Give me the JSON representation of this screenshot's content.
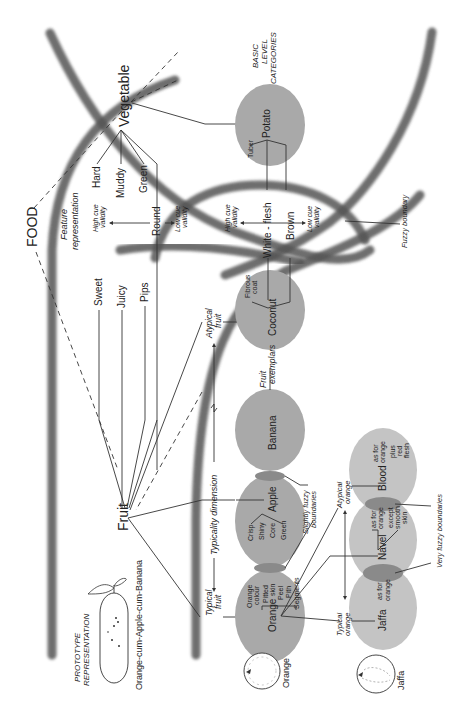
{
  "title": {
    "food": "FOOD",
    "fruit": "Fruit",
    "vegetable": "Vegetable",
    "basic_level": [
      "BASIC",
      "LEVEL",
      "CATEGORIES"
    ]
  },
  "prototype": {
    "heading": [
      "PROTOTYPE",
      "REPRESENTATION"
    ],
    "caption": "Orange-cum-Apple-cum-Banana"
  },
  "feature_representation": {
    "heading": [
      "Feature",
      "representation"
    ],
    "high_cue": [
      "High cue",
      "validity"
    ],
    "low_cue": [
      "Low cue",
      "validity"
    ],
    "fruit_features": [
      "Sweet",
      "Juicy",
      "Pips"
    ],
    "vegetable_features": [
      "Hard",
      "Muddy",
      "Green",
      "Round"
    ],
    "shared_features": [
      "White - flesh",
      "Brown"
    ]
  },
  "typicality": {
    "typical_fruit": [
      "Typical",
      "fruit"
    ],
    "dimension": "Typicality dimension",
    "atypical_fruit": [
      "Atypical",
      "fruit"
    ],
    "fruit_exemplars": [
      "Fruit",
      "exemplars"
    ]
  },
  "exemplars": {
    "orange": {
      "label": "Orange",
      "attributes": [
        "Orange",
        "colour",
        "Pitted",
        "skin",
        "Peel",
        "Pith",
        "Segments"
      ]
    },
    "apple": {
      "label": "Apple",
      "attributes": [
        "Crisp",
        "Shiny",
        "Core",
        "Green"
      ]
    },
    "banana": {
      "label": "Banana"
    },
    "coconut": {
      "label": "Coconut",
      "attributes": [
        "Fibrous",
        "coat"
      ]
    },
    "potato": {
      "label": "Potato",
      "attributes": [
        "Tuber"
      ]
    }
  },
  "orange_varieties": {
    "typical_orange": [
      "Typical",
      "orange"
    ],
    "atypical_orange": [
      "Atypical",
      "orange"
    ],
    "jaffa": {
      "label": "Jaffa",
      "attributes": [
        "as for",
        "orange"
      ]
    },
    "navel": {
      "label": "Navel",
      "attributes": [
        "as for",
        "orange",
        "except",
        "smooth",
        "skin"
      ]
    },
    "blood": {
      "label": "Blood",
      "attributes": [
        "as for",
        "orange",
        "plus",
        "red",
        "flesh"
      ]
    }
  },
  "annotations": {
    "slightly_fuzzy": [
      "Slightly fuzzy",
      "boundaries"
    ],
    "very_fuzzy": "Very fuzzy boundaries",
    "fuzzy_boundary": "Fuzzy boundary"
  },
  "illustrations": {
    "orange_label": "Orange",
    "jaffa_label": "Jaffa"
  },
  "colors": {
    "exemplar_fill": "#a9a9a9",
    "variety_fill": "#c4c4c4",
    "overlap_fill": "#8a8a8a",
    "boundary_stroke": "#555555",
    "line": "#333333"
  }
}
